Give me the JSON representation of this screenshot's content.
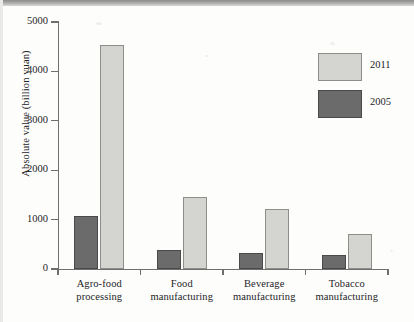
{
  "chart_data": {
    "type": "bar",
    "title": "",
    "xlabel": "",
    "ylabel": "Absolute value (billion yuan)",
    "ylim": [
      0,
      5000
    ],
    "yticks": [
      0,
      1000,
      2000,
      3000,
      4000,
      5000
    ],
    "ytick_labels": [
      "0",
      "1000",
      "2000",
      "3000",
      "4000",
      "5000"
    ],
    "grid": false,
    "legend_position": "upper right",
    "categories": [
      "Agro-food processing",
      "Food manufacturing",
      "Beverage manufacturing",
      "Tobacco manufacturing"
    ],
    "category_lines": [
      [
        "Agro-food",
        "processing"
      ],
      [
        "Food",
        "manufacturing"
      ],
      [
        "Beverage",
        "manufacturing"
      ],
      [
        "Tobacco",
        "manufacturing"
      ]
    ],
    "series": [
      {
        "name": "2005",
        "color": "#6b6b6b",
        "values": [
          1080,
          390,
          330,
          290
        ]
      },
      {
        "name": "2011",
        "color": "#d4d4d0",
        "values": [
          4530,
          1450,
          1220,
          700
        ]
      }
    ],
    "series_order_in_plot": [
      "2005",
      "2011"
    ],
    "legend_order": [
      "2011",
      "2005"
    ]
  },
  "legend": {
    "items": [
      {
        "label": "2011",
        "swatch": "light-gray"
      },
      {
        "label": "2005",
        "swatch": "dark-gray"
      }
    ]
  },
  "axis": {
    "y_title": "Absolute value (billion yuan)"
  }
}
